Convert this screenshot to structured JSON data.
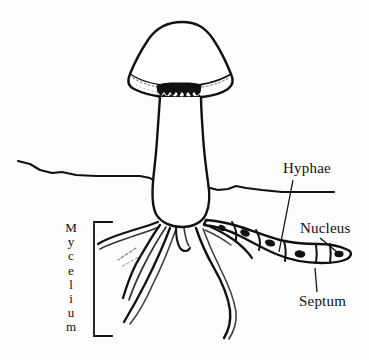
{
  "figure": {
    "type": "line-drawing",
    "background_color": "#fdfdfd",
    "ink_color": "#111111"
  },
  "labels": {
    "hyphae": "Hyphae",
    "nucleus": "Nucleus",
    "septum": "Septum",
    "mycelium": "Mycelium",
    "mycelium_letters": [
      "M",
      "y",
      "c",
      "e",
      "l",
      "i",
      "u",
      "m"
    ]
  },
  "parts": {
    "cap": "mushroom-cap",
    "gills": "gills-band",
    "stem": "mushroom-stem",
    "soil_line": "soil-surface-line",
    "roots": "mycelium-threads",
    "hypha_tube": "segmented-hypha",
    "nuclei": "nuclei-ellipses",
    "septa": "septa-cross-walls"
  },
  "leaders": {
    "hyphae": "leader-line-hyphae",
    "nucleus": "leader-line-nucleus",
    "septum": "leader-line-septum",
    "mycelium": "bracket-mycelium"
  }
}
